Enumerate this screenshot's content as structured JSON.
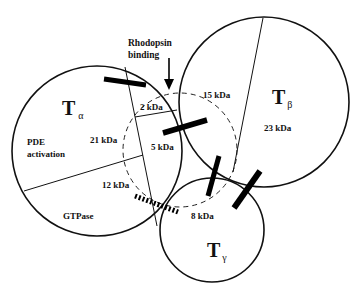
{
  "diagram": {
    "type": "transducin subunit interaction diagram",
    "annotation": {
      "line1": "Rhodopsin",
      "line2": "binding"
    },
    "subunits": {
      "alpha": {
        "symbol": "T",
        "subscript": "α",
        "regions": {
          "pde": "PDE",
          "activation": "activation",
          "mass_21": "21 kDa",
          "mass_12": "12 kDa",
          "gtpase": "GTPase",
          "mass_2": "2 kDa",
          "mass_5": "5 kDa"
        }
      },
      "beta": {
        "symbol": "T",
        "subscript": "β",
        "mass_23": "23 kDa",
        "mass_15": "15 kDa"
      },
      "gamma": {
        "symbol": "T",
        "subscript": "γ",
        "mass_8": "8 kDa"
      }
    },
    "colors": {
      "stroke": "#111111",
      "background": "#ffffff"
    }
  }
}
